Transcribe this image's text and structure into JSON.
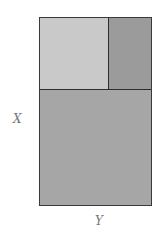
{
  "diagram": {
    "type": "partitioned-rectangle",
    "labels": {
      "x_axis": "X",
      "y_axis": "Y"
    },
    "regions": [
      {
        "id": "top-left",
        "color": "#c9c9c9"
      },
      {
        "id": "top-right",
        "color": "#9b9b9b"
      },
      {
        "id": "bottom",
        "color": "#a6a6a6"
      }
    ],
    "border_color": "#2e2e2e"
  }
}
